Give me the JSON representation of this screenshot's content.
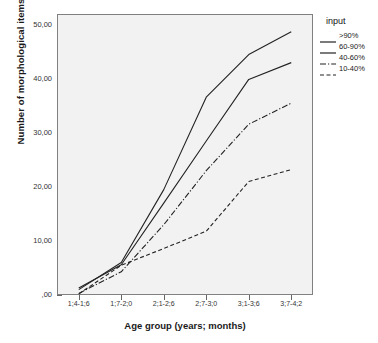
{
  "chart_data": {
    "type": "line",
    "title": "",
    "xlabel": "Age group (years; months)",
    "ylabel": "Number of morphological items",
    "categories": [
      "1;4-1;6",
      "1;7-2;0",
      "2;1-2;6",
      "2;7-3;0",
      "3;1-3;6",
      "3;7-4;2"
    ],
    "ylim": [
      0,
      52
    ],
    "ytick_labels": [
      ",00",
      "10,00",
      "20,00",
      "30,00",
      "40,00",
      "50,00"
    ],
    "ytick_values": [
      0,
      10,
      20,
      30,
      40,
      50
    ],
    "grid": false,
    "legend_position": "right",
    "legend_title": "input",
    "series": [
      {
        "name": ">90%",
        "style": "solid",
        "values": [
          1.0,
          6.0,
          19.5,
          36.6,
          44.5,
          48.7
        ]
      },
      {
        "name": "60-90%",
        "style": "solid",
        "values": [
          1.3,
          5.6,
          17.0,
          28.5,
          39.9,
          43.0
        ]
      },
      {
        "name": "40-60%",
        "style": "dash-dot",
        "values": [
          0.3,
          4.3,
          13.0,
          23.0,
          31.6,
          35.5
        ]
      },
      {
        "name": "10-40%",
        "style": "dashed",
        "values": [
          0.2,
          5.5,
          8.6,
          11.8,
          21.0,
          23.2
        ]
      }
    ]
  },
  "colors": {
    "plot_background": "#f2f2f2",
    "frame": "#808080",
    "line": "#222222",
    "text": "#1a1a1a"
  }
}
